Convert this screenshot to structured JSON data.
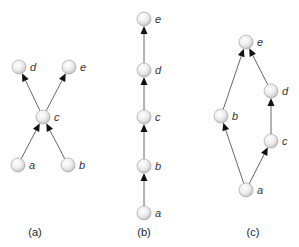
{
  "colors": {
    "node_fill_light": "#fafafa",
    "node_fill_dark": "#c8c8c8",
    "node_stroke": "#9a9a9a",
    "edge": "#555555",
    "arrow": "#111111"
  },
  "diagrams": [
    {
      "caption": "(a)",
      "caption_pos": [
        35,
        236
      ],
      "nodes": [
        {
          "id": "a",
          "label": "a",
          "x": 18,
          "y": 165
        },
        {
          "id": "b",
          "label": "b",
          "x": 68,
          "y": 165
        },
        {
          "id": "c",
          "label": "c",
          "x": 43,
          "y": 117
        },
        {
          "id": "d",
          "label": "d",
          "x": 19,
          "y": 67
        },
        {
          "id": "e",
          "label": "e",
          "x": 69,
          "y": 67
        }
      ],
      "edges": [
        {
          "from": "a",
          "to": "c"
        },
        {
          "from": "b",
          "to": "c"
        },
        {
          "from": "c",
          "to": "d"
        },
        {
          "from": "c",
          "to": "e"
        }
      ]
    },
    {
      "caption": "(b)",
      "caption_pos": [
        144,
        236
      ],
      "nodes": [
        {
          "id": "a",
          "label": "a",
          "x": 144,
          "y": 213
        },
        {
          "id": "b",
          "label": "b",
          "x": 144,
          "y": 166
        },
        {
          "id": "c",
          "label": "c",
          "x": 144,
          "y": 117
        },
        {
          "id": "d",
          "label": "d",
          "x": 144,
          "y": 70
        },
        {
          "id": "e",
          "label": "e",
          "x": 144,
          "y": 19
        }
      ],
      "edges": [
        {
          "from": "a",
          "to": "b"
        },
        {
          "from": "b",
          "to": "c"
        },
        {
          "from": "c",
          "to": "d"
        },
        {
          "from": "d",
          "to": "e"
        }
      ]
    },
    {
      "caption": "(c)",
      "caption_pos": [
        253,
        236
      ],
      "nodes": [
        {
          "id": "a",
          "label": "a",
          "x": 246,
          "y": 190
        },
        {
          "id": "b",
          "label": "b",
          "x": 221,
          "y": 116
        },
        {
          "id": "c",
          "label": "c",
          "x": 271,
          "y": 141
        },
        {
          "id": "d",
          "label": "d",
          "x": 271,
          "y": 91
        },
        {
          "id": "e",
          "label": "e",
          "x": 246,
          "y": 42
        }
      ],
      "edges": [
        {
          "from": "a",
          "to": "b"
        },
        {
          "from": "a",
          "to": "c"
        },
        {
          "from": "c",
          "to": "d"
        },
        {
          "from": "b",
          "to": "e"
        },
        {
          "from": "d",
          "to": "e"
        }
      ]
    }
  ]
}
